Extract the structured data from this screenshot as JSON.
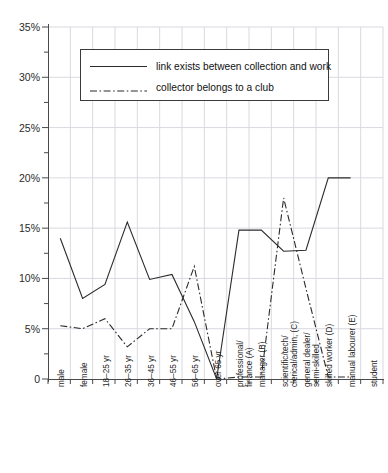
{
  "title": {
    "text": "",
    "clipped": true,
    "note": "chart title is cropped off the top edge and not legible"
  },
  "legend": {
    "position": "upper-left-inside",
    "entries": [
      {
        "label": "link exists between collection and work",
        "style": "solid",
        "key": "solid-line-key"
      },
      {
        "label": "collector belongs to a club",
        "style": "dash-dot",
        "key": "dashdot-line-key"
      }
    ]
  },
  "axes": {
    "y": {
      "label": "",
      "ticklabels": [
        "0",
        "5%",
        "10%",
        "15%",
        "20%",
        "25%",
        "30%",
        "35%"
      ],
      "values": [
        0,
        5,
        10,
        15,
        20,
        25,
        30,
        35
      ],
      "min": 0,
      "max": 35,
      "major_step": 5,
      "minor_step": 2.5
    },
    "x": {
      "label": "",
      "ticklabels": [
        "male",
        "female",
        "18–25 yr",
        "26–35 yr",
        "36–45 yr",
        "46–55 yr",
        "56–65 yr",
        "over 65 yr",
        "professional/\nfinance (A)",
        "manager (B)",
        "scientific/tech/\nclerical/admin, (C)",
        "general dealer/\nsemi-skilled",
        "skilled worker (D)",
        "manual labourer (E)",
        "student"
      ]
    }
  },
  "grid": {
    "x": true,
    "y": true,
    "color": "#d9d9e0"
  },
  "colors": {
    "line": "#2b2b2b",
    "axis": "#4a4a4a",
    "grid": "#d9d9e0",
    "background": "#ffffff",
    "text": "#1a1a1a"
  },
  "chart_data": {
    "type": "line",
    "title": "",
    "xlabel": "",
    "ylabel": "",
    "ylim": [
      0,
      35
    ],
    "yunit": "%",
    "grid": true,
    "legend_position": "upper left",
    "categories": [
      "male",
      "female",
      "18–25 yr",
      "26–35 yr",
      "36–45 yr",
      "46–55 yr",
      "56–65 yr",
      "over 65 yr",
      "professional/finance (A)",
      "manager (B)",
      "scientific/tech/clerical/admin, (C)",
      "general dealer/semi-skilled",
      "skilled worker (D)",
      "manual labourer (E)",
      "student"
    ],
    "series": [
      {
        "name": "link exists between collection and work",
        "style": "solid",
        "values": [
          14.0,
          8.0,
          9.4,
          15.6,
          9.9,
          10.4,
          5.7,
          0,
          14.8,
          14.8,
          12.7,
          12.8,
          20.0,
          20.0,
          null
        ]
      },
      {
        "name": "collector belongs to a club",
        "style": "dash-dot",
        "values": [
          5.3,
          5.0,
          6.0,
          3.2,
          5.0,
          5.0,
          11.2,
          0,
          0.2,
          0.2,
          18.0,
          9.0,
          0.2,
          0.2,
          null
        ]
      }
    ]
  }
}
